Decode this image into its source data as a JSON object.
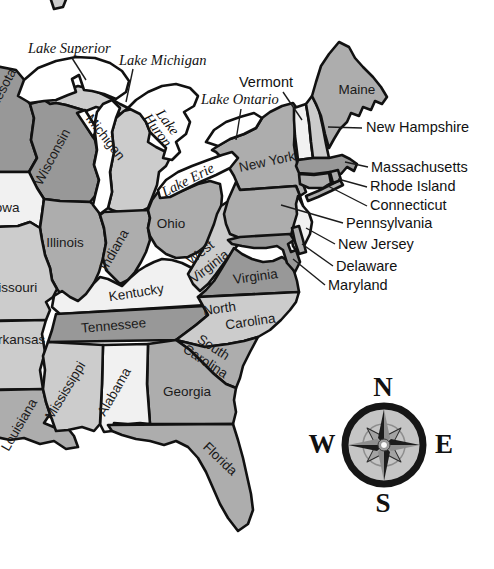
{
  "map": {
    "states": {
      "minnesota": "Minnesota",
      "wisconsin": "Wisconsin",
      "michigan": "Michigan",
      "iowa": "Iowa",
      "missouri": "Missouri",
      "illinois": "Illinois",
      "indiana": "Indiana",
      "ohio": "Ohio",
      "kentucky": "Kentucky",
      "west_virginia": {
        "line1": "West",
        "line2": "Virginia"
      },
      "virginia": "Virginia",
      "tennessee": "Tennessee",
      "arkansas": "Arkansas",
      "north_carolina": {
        "line1": "North",
        "line2": "Carolina"
      },
      "south_carolina": {
        "line1": "South",
        "line2": "Carolina"
      },
      "georgia": "Georgia",
      "alabama": "Alabama",
      "mississippi": "Mississippi",
      "louisiana": "Louisiana",
      "florida": "Florida",
      "new_york": "New York",
      "vermont": "Vermont",
      "maine": "Maine",
      "new_hampshire": "New Hampshire",
      "massachusetts": "Massachusetts",
      "rhode_island": "Rhode Island",
      "connecticut": "Connecticut",
      "pennsylvania": "Pennsylvania",
      "new_jersey": "New Jersey",
      "delaware": "Delaware",
      "maryland": "Maryland"
    },
    "lakes": {
      "superior": "Lake Superior",
      "michigan": "Lake Michigan",
      "huron": {
        "line1": "Lake",
        "line2": "Huron"
      },
      "erie": "Lake Erie",
      "ontario": "Lake Ontario"
    },
    "compass": {
      "north": "N",
      "east": "E",
      "south": "S",
      "west": "W"
    },
    "palette": {
      "state_dark": "#989898",
      "state_medium": "#adadad",
      "state_light": "#cccccc",
      "state_pale": "#f1f1f1",
      "water": "#ffffff",
      "border": "#111111",
      "compass_face": "#c5c5c5"
    }
  }
}
